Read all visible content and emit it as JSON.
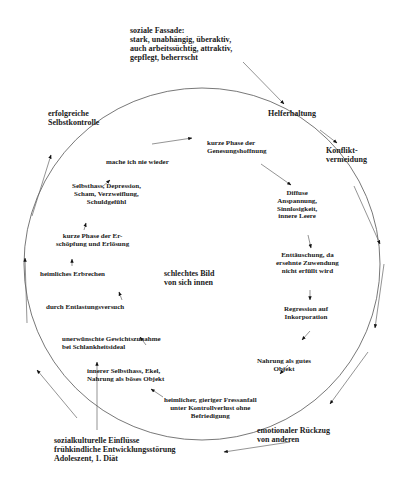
{
  "diagram": {
    "outer": {
      "social_facade": "soziale Fassade:\nstark, unabhängig, überaktiv,\nauch arbeitssüchtig, attraktiv,\ngepflegt, beherrscht",
      "helper_attitude": "Helferhaltung",
      "conflict_avoidance": "Konflikt-\nvermeidung",
      "emotional_withdrawal": "emotionaler Rückzug\nvon anderen",
      "sociocultural": "sozialkulturelle Einflüsse\nfrühkindliche Entwicklungsstörung\nAdoleszent, 1. Diät",
      "successful_control": "erfolgreiche\nSelbstkontrolle"
    },
    "center": "schlechtes Bild\nvon sich innen",
    "inner_cycle": [
      "kurze Phase der\nGenesungshoffnung",
      "Diffuse\nAnspannung,\nSinnlosigkeit,\ninnere Leere",
      "Enttäuschung, da\nersehnte Zuwendung\nnicht erfüllt wird",
      "Regression auf\nInkorporation",
      "Nahrung als gutes\nObjekt",
      "heimlicher, gieriger Fressanfall\nunter Kontrollverlust ohne\nBefriedigung",
      "innerer Selbsthass, Ekel,\nNahrung als böses Objekt",
      "unerwünschte Gewichtszunahme\nbei Schlankheitsideal",
      "durch Entlastungsversuch",
      "heimliches Erbrechen",
      "kurze Phase der Er-\nschöpfung und Erlösung",
      "Selbsthass, Depression,\nScham, Verzweiflung,\nSchuldgefühl",
      "mache ich nie wieder"
    ],
    "colors": {
      "text": "#1a1a1a",
      "lines": "#555555",
      "background": "#ffffff"
    }
  }
}
